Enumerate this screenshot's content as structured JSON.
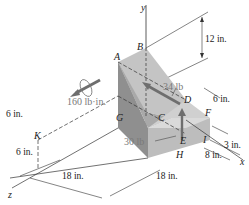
{
  "figure": {
    "axes": {
      "y": "y",
      "x": "x",
      "z": "z"
    },
    "points": {
      "A": "A",
      "B": "B",
      "C": "C",
      "D": "D",
      "E": "E",
      "F": "F",
      "G": "G",
      "H": "H",
      "I": "I",
      "K": "K"
    },
    "loads": {
      "couple": "160 lb·in.",
      "force_D": "34 lb",
      "force_E": "30 lb"
    },
    "dimensions": {
      "height_B": "12 in.",
      "width_DF": "6 in.",
      "height_F": "3 in.",
      "depth_I": "8 in.",
      "k_height": "6 in.",
      "k_offset": "6 in.",
      "z_len1": "18 in.",
      "z_len2": "18 in."
    },
    "colors": {
      "face_dark": "#8c8c8c",
      "face_mid": "#b4b4b4",
      "face_light": "#d4d4d4",
      "face_top": "#c8c8c8",
      "arrow": "#6e6e6e",
      "line": "#333333"
    }
  }
}
